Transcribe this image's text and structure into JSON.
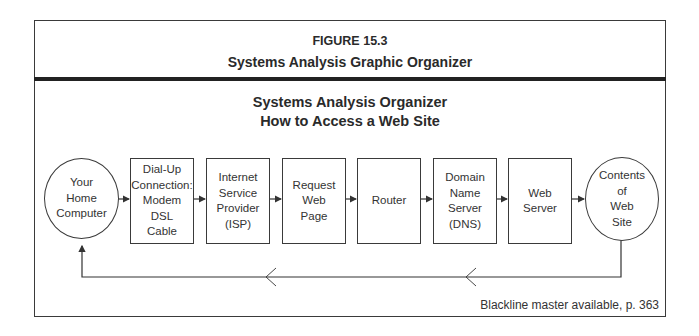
{
  "figure": {
    "number": "FIGURE 15.3",
    "title": "Systems Analysis Graphic Organizer"
  },
  "organizer": {
    "title_line1": "Systems Analysis Organizer",
    "title_line2": "How to Access a Web Site"
  },
  "flow": {
    "start": "Your\nHome\nComputer",
    "steps": [
      "Dial-Up\nConnection:\nModem\nDSL\nCable",
      "Internet\nService\nProvider\n(ISP)",
      "Request\nWeb\nPage",
      "Router",
      "Domain\nName\nServer\n(DNS)",
      "Web\nServer"
    ],
    "end": "Contents\nof\nWeb\nSite"
  },
  "footer": {
    "note": "Blackline master available, p. 363"
  }
}
